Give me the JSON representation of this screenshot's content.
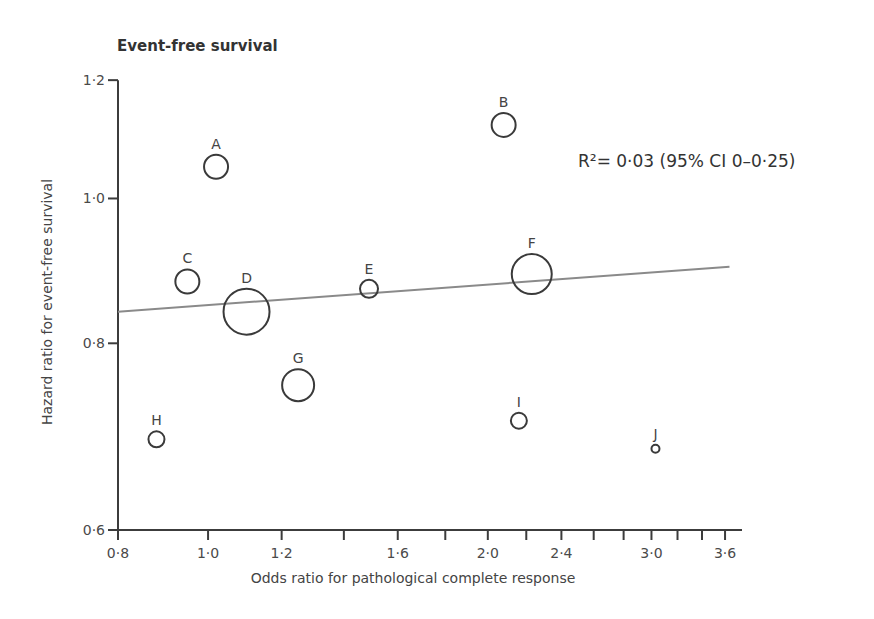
{
  "chart_data": {
    "type": "scatter",
    "title": "Event-free survival",
    "xlabel": "Odds ratio for pathological complete response",
    "ylabel": "Hazard ratio for event-free survival",
    "xscale": "log",
    "yscale": "log",
    "xlim": [
      0.8,
      3.9
    ],
    "ylim": [
      0.6,
      1.2
    ],
    "x_ticks": [
      0.8,
      1.0,
      1.2,
      1.4,
      1.6,
      1.8,
      2.0,
      2.2,
      2.4,
      2.6,
      2.8,
      3.0,
      3.2,
      3.4,
      3.6
    ],
    "x_tick_labels": [
      {
        "value": 0.8,
        "label": "0·8"
      },
      {
        "value": 1.0,
        "label": "1·0"
      },
      {
        "value": 1.2,
        "label": "1·2"
      },
      {
        "value": 1.6,
        "label": "1·6"
      },
      {
        "value": 2.0,
        "label": "2·0"
      },
      {
        "value": 2.4,
        "label": "2·4"
      },
      {
        "value": 3.0,
        "label": "3·0"
      },
      {
        "value": 3.6,
        "label": "3·6"
      }
    ],
    "y_ticks": [
      0.6,
      0.8,
      1.0,
      1.2
    ],
    "y_tick_labels": [
      {
        "value": 0.6,
        "label": "0·6"
      },
      {
        "value": 0.8,
        "label": "0·8"
      },
      {
        "value": 1.0,
        "label": "1·0"
      },
      {
        "value": 1.2,
        "label": "1·2"
      }
    ],
    "grid": false,
    "legend": null,
    "points": [
      {
        "label": "A",
        "x": 1.02,
        "y": 1.05,
        "size": 12
      },
      {
        "label": "B",
        "x": 2.08,
        "y": 1.12,
        "size": 12
      },
      {
        "label": "C",
        "x": 0.95,
        "y": 0.88,
        "size": 12
      },
      {
        "label": "D",
        "x": 1.1,
        "y": 0.84,
        "size": 23
      },
      {
        "label": "E",
        "x": 1.49,
        "y": 0.87,
        "size": 9
      },
      {
        "label": "F",
        "x": 2.23,
        "y": 0.89,
        "size": 20
      },
      {
        "label": "G",
        "x": 1.25,
        "y": 0.75,
        "size": 16
      },
      {
        "label": "H",
        "x": 0.88,
        "y": 0.69,
        "size": 8
      },
      {
        "label": "I",
        "x": 2.16,
        "y": 0.71,
        "size": 8
      },
      {
        "label": "J",
        "x": 3.03,
        "y": 0.68,
        "size": 4
      }
    ],
    "regression_line": {
      "x": [
        0.8,
        3.64
      ],
      "y": [
        0.84,
        0.9
      ]
    },
    "annotation": "R²= 0·03   (95% CI 0–0·25)",
    "r_squared": 0.03,
    "ci_95": [
      0,
      0.25
    ]
  }
}
